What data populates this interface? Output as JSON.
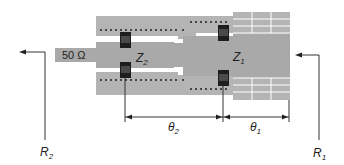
{
  "diagram": {
    "port_label": "50 Ω",
    "sections": [
      {
        "id": "Z2",
        "label_main": "Z",
        "label_sub": "2"
      },
      {
        "id": "Z1",
        "label_main": "Z",
        "label_sub": "1"
      }
    ],
    "dimensions": [
      {
        "id": "theta2",
        "label_main": "θ",
        "label_sub": "2"
      },
      {
        "id": "theta1",
        "label_main": "θ",
        "label_sub": "1"
      }
    ],
    "references": [
      {
        "id": "R2",
        "label_main": "R",
        "label_sub": "2"
      },
      {
        "id": "R1",
        "label_main": "R",
        "label_sub": "1"
      }
    ],
    "colors": {
      "substrate": "#b4b4b4",
      "trace": "#a9a9a9",
      "component": "#1e1e1e",
      "line": "#333333",
      "grid_line": "#ffffff"
    }
  }
}
